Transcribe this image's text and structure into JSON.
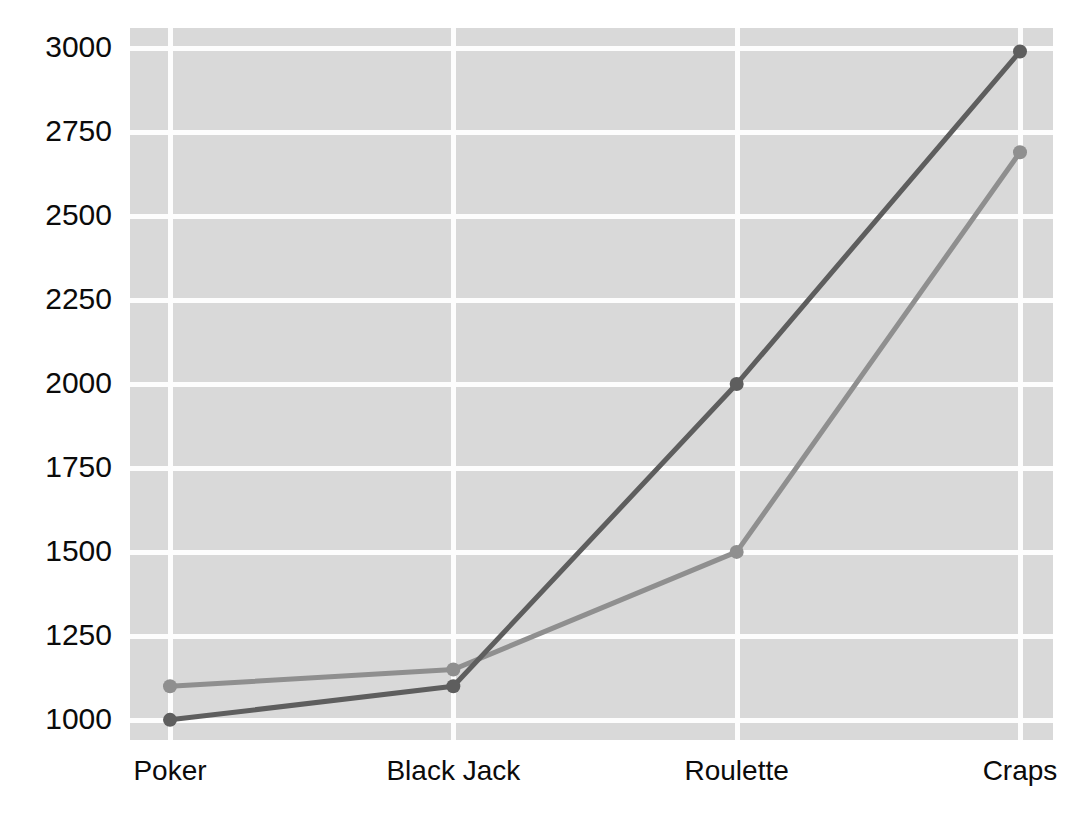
{
  "chart_data": {
    "type": "line",
    "title": "",
    "subtitle": "",
    "xlabel": "",
    "ylabel": "",
    "categories": [
      "Poker",
      "Black Jack",
      "Roulette",
      "Craps"
    ],
    "series": [
      {
        "name": "series-1",
        "color": "#8f8f8f",
        "values": [
          1100,
          1150,
          1500,
          2690
        ]
      },
      {
        "name": "series-2",
        "color": "#5e5e5e",
        "values": [
          1000,
          1100,
          2000,
          2990
        ]
      }
    ],
    "ylim": [
      940,
      3060
    ],
    "yticks": [
      1000,
      1250,
      1500,
      1750,
      2000,
      2250,
      2500,
      2750,
      3000
    ],
    "ytick_labels": [
      "1000",
      "1250",
      "1500",
      "1750",
      "2000",
      "2250",
      "2500",
      "2750",
      "3000"
    ],
    "grid": true,
    "grid_color": "#fdfdfd",
    "plot_background": "#d9d9d9",
    "page_background": "#ffffff",
    "legend": false,
    "legend_position": "none",
    "markers": true,
    "marker_shape": "circle",
    "tick_label_color": "#0b0b0b"
  }
}
